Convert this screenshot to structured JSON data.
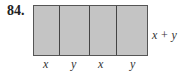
{
  "problem_number": "84.",
  "diagram": {
    "fill_color": "#c4c4c4",
    "border_color": "#444444",
    "segments": [
      {
        "label": "x",
        "width": 26
      },
      {
        "label": "y",
        "width": 31
      },
      {
        "label": "x",
        "width": 27
      },
      {
        "label": "y",
        "width": 31
      }
    ],
    "side_label": "x + y"
  }
}
